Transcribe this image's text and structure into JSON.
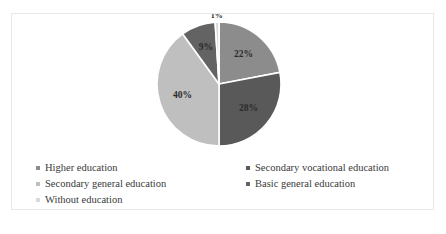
{
  "chart_data": {
    "type": "pie",
    "title": "",
    "labels": [
      "Higher education",
      "Secondary vocational education",
      "Secondary general education",
      "Basic general education",
      "Without education"
    ],
    "values": [
      22,
      28,
      40,
      9,
      1
    ],
    "value_labels": [
      "22%",
      "28%",
      "40%",
      "9%",
      "1%"
    ],
    "colors": [
      "#8c8c8c",
      "#595959",
      "#bfbfbf",
      "#636363",
      "#d9d9d9"
    ],
    "units": "percent",
    "legend_position": "bottom",
    "grid": false,
    "start_angle_deg": 0,
    "direction": "clockwise",
    "slice_separator_color": "#ffffff"
  },
  "legend": {
    "columns": [
      {
        "items": [
          {
            "label": "Higher education",
            "color": "#8c8c8c"
          },
          {
            "label": "Secondary general education",
            "color": "#bfbfbf"
          },
          {
            "label": "Without education",
            "color": "#d9d9d9"
          }
        ]
      },
      {
        "items": [
          {
            "label": "Secondary vocational education",
            "color": "#595959"
          },
          {
            "label": "Basic general education",
            "color": "#636363"
          }
        ]
      }
    ]
  },
  "frame": {
    "border_color": "#e8e8e8",
    "background": "#ffffff"
  }
}
